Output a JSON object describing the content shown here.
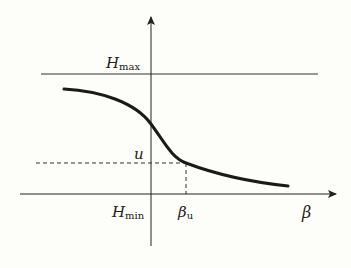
{
  "diagram": {
    "labels": {
      "hmax_main": "H",
      "hmax_sub": "max",
      "hmin_main": "H",
      "hmin_sub": "min",
      "u": "u",
      "beta_u_main": "β",
      "beta_u_sub": "u",
      "beta_axis": "β"
    },
    "colors": {
      "background": "#fdfdf9",
      "line": "#222222",
      "curve": "#1a1a1a"
    },
    "elements": {
      "hmax_line": "Horizontal line at H_max",
      "x_axis": "β axis",
      "y_axis": "vertical axis",
      "curve": "decreasing sigmoid-like curve",
      "u_dashed": "dashed horizontal guide at u",
      "beta_u_dashed": "dashed vertical guide at β_u"
    }
  }
}
